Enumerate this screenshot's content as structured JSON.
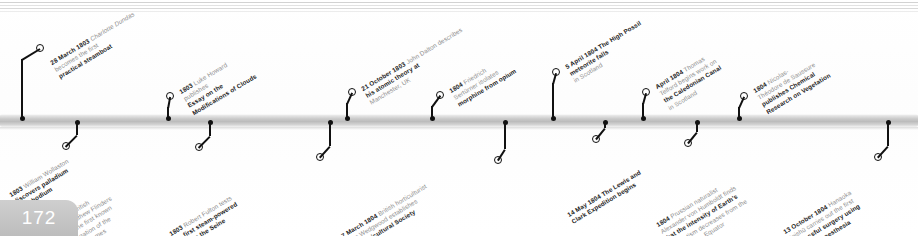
{
  "page": {
    "number": "172",
    "accent_color": "#bdbdbd",
    "bar_color": "#c9c9c9",
    "text_muted": "#8d8d8d",
    "text_strong": "#1c1c1c"
  },
  "timeline": {
    "events_above": [
      {
        "date": "28 March 1803",
        "lines": [
          {
            "text": "Charlotte Dundas",
            "style": "italic"
          },
          {
            "text": "becomes the first",
            "style": "muted"
          },
          {
            "text": "practical steamboat",
            "style": "strong"
          }
        ],
        "x": 22,
        "ring_x": 40,
        "ring_y": 48,
        "label_x": 49,
        "label_y": 60
      },
      {
        "date": "1803",
        "lines": [
          {
            "text": "Luke Howard",
            "style": "muted"
          },
          {
            "text": "publishes ",
            "style": "muted"
          },
          {
            "text": "Essay on the",
            "style": "strong"
          },
          {
            "text": "Modifications of Clouds",
            "style": "strong"
          }
        ],
        "x": 168,
        "ring_x": 170,
        "ring_y": 96,
        "label_x": 178,
        "label_y": 89
      },
      {
        "date": "21 October 1803",
        "lines": [
          {
            "text": "John Dalton describes",
            "style": "muted"
          },
          {
            "text": "his atomic theory at",
            "style": "strong"
          },
          {
            "text": "Manchester, UK",
            "style": "muted"
          }
        ],
        "x": 347,
        "ring_x": 352,
        "ring_y": 92,
        "label_x": 360,
        "label_y": 86
      },
      {
        "date": "1804",
        "lines": [
          {
            "text": "Friedrich",
            "style": "muted"
          },
          {
            "text": "Sertürner isolates",
            "style": "muted"
          },
          {
            "text": "morphine from opium",
            "style": "strong"
          }
        ],
        "x": 432,
        "ring_x": 440,
        "ring_y": 95,
        "label_x": 448,
        "label_y": 88
      },
      {
        "date": "5 April 1804",
        "lines": [
          {
            "text": "The High Possil",
            "style": "strong"
          },
          {
            "text": "meteorite falls",
            "style": "strong"
          },
          {
            "text": "in Scotland",
            "style": "muted"
          }
        ],
        "x": 553,
        "ring_x": 556,
        "ring_y": 72,
        "label_x": 564,
        "label_y": 64
      },
      {
        "date": "April 1804",
        "lines": [
          {
            "text": "Thomas",
            "style": "muted"
          },
          {
            "text": "Telford begins work on",
            "style": "muted"
          },
          {
            "text": "the Caledonian Canal",
            "style": "strong"
          },
          {
            "text": "in Scotland",
            "style": "muted"
          }
        ],
        "x": 643,
        "ring_x": 646,
        "ring_y": 92,
        "label_x": 654,
        "label_y": 84
      },
      {
        "date": "1804",
        "lines": [
          {
            "text": "Nicolas-",
            "style": "muted"
          },
          {
            "text": "Théodore de Saussure",
            "style": "muted"
          },
          {
            "text": "publishes Chemical",
            "style": "strong"
          },
          {
            "text": "Research on Vegetation",
            "style": "strong"
          }
        ],
        "x": 739,
        "ring_x": 744,
        "ring_y": 96,
        "label_x": 752,
        "label_y": 88
      }
    ],
    "events_below": [
      {
        "date": "1803",
        "lines": [
          {
            "text": "William Wollaston",
            "style": "muted"
          },
          {
            "text": "discovers palladium",
            "style": "strong"
          },
          {
            "text": "and rhodium",
            "style": "strong"
          }
        ],
        "x": 77,
        "ring_x": 66,
        "ring_y": 146,
        "label_x": 8,
        "label_y": 192
      },
      {
        "date": "9 June 1803",
        "lines": [
          {
            "text": "British",
            "style": "muted"
          },
          {
            "text": "navigator Matthew Flinders",
            "style": "muted"
          },
          {
            "text": "completes the first known",
            "style": "muted"
          },
          {
            "text": "circumnavigation of the",
            "style": "muted"
          },
          {
            "text": "continent he names",
            "style": "muted"
          },
          {
            "text": "Australia",
            "style": "strong"
          }
        ],
        "x": 210,
        "ring_x": 199,
        "ring_y": 147,
        "label_x": 38,
        "label_y": 228
      },
      {
        "date": "1803",
        "lines": [
          {
            "text": "Robert Fulton tests",
            "style": "muted"
          },
          {
            "text": "his first steam-powered",
            "style": "strong"
          },
          {
            "text": "boat on the Seine",
            "style": "strong"
          },
          {
            "text": "in France",
            "style": "muted"
          }
        ],
        "x": 330,
        "ring_x": 320,
        "ring_y": 157,
        "label_x": 168,
        "label_y": 231
      },
      {
        "date": "7 March 1804",
        "lines": [
          {
            "text": "British horticulturist",
            "style": "muted"
          },
          {
            "text": "John Wedgwood establishes",
            "style": "muted"
          },
          {
            "text": "the Horticultural Society",
            "style": "strong"
          },
          {
            "text": "of London",
            "style": "strong"
          }
        ],
        "x": 505,
        "ring_x": 498,
        "ring_y": 160,
        "label_x": 340,
        "label_y": 233
      },
      {
        "date": "14 May 1804",
        "lines": [
          {
            "text": "The Lewis and",
            "style": "strong"
          },
          {
            "text": "Clark Expedition begins",
            "style": "strong"
          }
        ],
        "x": 605,
        "ring_x": 596,
        "ring_y": 139,
        "label_x": 566,
        "label_y": 212
      },
      {
        "date": "1804",
        "lines": [
          {
            "text": "Prussian naturalist",
            "style": "muted"
          },
          {
            "text": "Alexander von Humboldt finds",
            "style": "muted"
          },
          {
            "text": "that the intensity of Earth's",
            "style": "strong"
          },
          {
            "text": "magnetism decreases from the",
            "style": "muted"
          },
          {
            "text": "poles to the Equator",
            "style": "muted"
          }
        ],
        "x": 697,
        "ring_x": 688,
        "ring_y": 143,
        "label_x": 655,
        "label_y": 222
      },
      {
        "date": "13 October 1804",
        "lines": [
          {
            "text": "Hanaoka",
            "style": "muted"
          },
          {
            "text": "Seishū carries out the first",
            "style": "muted"
          },
          {
            "text": "successful surgery using",
            "style": "strong"
          },
          {
            "text": "general anaesthesia",
            "style": "strong"
          }
        ],
        "x": 888,
        "ring_x": 878,
        "ring_y": 157,
        "label_x": 782,
        "label_y": 229
      }
    ],
    "plain_ticks_above": [
      22,
      168,
      347,
      432,
      553,
      643,
      739
    ],
    "plain_ticks_below": []
  }
}
